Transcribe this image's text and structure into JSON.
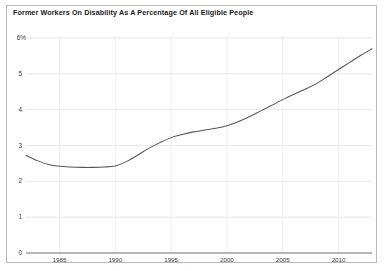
{
  "chart": {
    "title": "Former Workers On Disability As A Percentage Of All Eligible People",
    "border_color": "#b9b9b9",
    "line_color": "#555555",
    "grid_color": "#dcdcdc",
    "axis_color": "#6e6e6e"
  },
  "chart_data": {
    "type": "line",
    "title": "Former Workers On Disability As A Percentage Of All Eligible People",
    "xlabel": "",
    "ylabel": "",
    "ylim": [
      0,
      6
    ],
    "xlim": [
      1982,
      2013
    ],
    "grid": true,
    "legend": "none",
    "y_ticks": [
      0,
      1,
      2,
      3,
      4,
      5,
      6
    ],
    "y_tick_labels": [
      "0",
      "1",
      "2",
      "3",
      "4",
      "5",
      "6%"
    ],
    "x_ticks": [
      1985,
      1990,
      1995,
      2000,
      2005,
      2010
    ],
    "x_tick_labels": [
      "1985",
      "1990",
      "1995",
      "2000",
      "2005",
      "2010"
    ],
    "series": [
      {
        "name": "Former workers on disability (% of eligible)",
        "x": [
          1982,
          1983,
          1984,
          1985,
          1986,
          1987,
          1988,
          1989,
          1990,
          1991,
          1992,
          1993,
          1994,
          1995,
          1996,
          1997,
          1998,
          1999,
          2000,
          2001,
          2002,
          2003,
          2004,
          2005,
          2006,
          2007,
          2008,
          2009,
          2010,
          2011,
          2012,
          2013
        ],
        "values": [
          2.72,
          2.58,
          2.47,
          2.42,
          2.4,
          2.39,
          2.39,
          2.4,
          2.43,
          2.55,
          2.73,
          2.92,
          3.08,
          3.22,
          3.31,
          3.38,
          3.43,
          3.48,
          3.55,
          3.66,
          3.8,
          3.96,
          4.12,
          4.28,
          4.43,
          4.57,
          4.72,
          4.92,
          5.12,
          5.32,
          5.52,
          5.7
        ]
      }
    ]
  }
}
